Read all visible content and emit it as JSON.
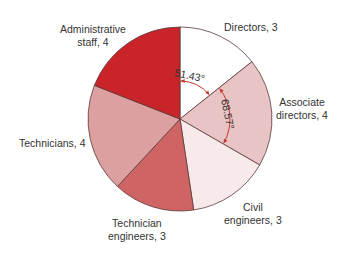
{
  "chart_data": {
    "type": "pie",
    "title": "",
    "total": 21,
    "start_angle_deg": 0,
    "direction": "clockwise",
    "slices": [
      {
        "label": "Directors",
        "value": 3,
        "angle_deg": 51.43,
        "color": "#ffffff"
      },
      {
        "label": "Associate directors",
        "value": 4,
        "angle_deg": 68.57,
        "color": "#e8c4c4"
      },
      {
        "label": "Civil engineers",
        "value": 3,
        "angle_deg": 51.43,
        "color": "#f8eaea"
      },
      {
        "label": "Technician engineers",
        "value": 3,
        "angle_deg": 51.43,
        "color": "#cf6464"
      },
      {
        "label": "Technicians",
        "value": 4,
        "angle_deg": 68.57,
        "color": "#dca0a0"
      },
      {
        "label": "Administrative staff",
        "value": 4,
        "angle_deg": 68.57,
        "color": "#c8242a"
      }
    ],
    "annotations": [
      {
        "text": "51.43°",
        "refers_to": "Directors"
      },
      {
        "text": "68.57°",
        "refers_to": "Associate directors"
      }
    ],
    "legend": "none (direct labels)"
  },
  "labels": {
    "directors": [
      "Directors, 3"
    ],
    "associate": [
      "Associate",
      "directors, 4"
    ],
    "civil": [
      "Civil",
      "engineers, 3"
    ],
    "techeng": [
      "Technician",
      "engineers, 3"
    ],
    "technicians": [
      "Technicians, 4"
    ],
    "admin": [
      "Administrative",
      "staff, 4"
    ]
  },
  "angles": {
    "a1": "51.43°",
    "a2": "68.57°"
  },
  "style": {
    "outline": "#5a3a3a",
    "arrow": "#c0392b"
  }
}
